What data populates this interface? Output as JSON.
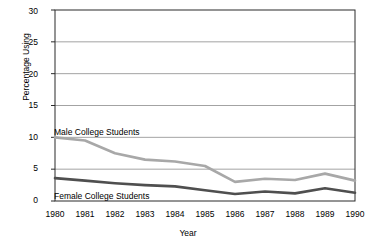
{
  "chart_data": {
    "type": "line",
    "title": "",
    "xlabel": "Year",
    "ylabel": "Percentage Using",
    "categories": [
      "1980",
      "1981",
      "1982",
      "1983",
      "1984",
      "1985",
      "1986",
      "1987",
      "1988",
      "1989",
      "1990"
    ],
    "x": [
      1980,
      1981,
      1982,
      1983,
      1984,
      1985,
      1986,
      1987,
      1988,
      1989,
      1990
    ],
    "xlim": [
      1980,
      1990
    ],
    "ylim": [
      0,
      30
    ],
    "yticks": [
      0,
      5,
      10,
      15,
      20,
      25,
      30
    ],
    "ytick_labels": [
      "0",
      "5",
      "10",
      "15",
      "20",
      "25",
      "30"
    ],
    "grid": true,
    "grid_axis": "y",
    "legend": "inline-annotations",
    "series": [
      {
        "name": "Male College Students",
        "color": "#a8a8a8",
        "width": 2.6,
        "values": [
          10.0,
          9.5,
          7.5,
          6.5,
          6.2,
          5.5,
          3.0,
          3.5,
          3.3,
          4.3,
          3.2
        ]
      },
      {
        "name": "Female College Students",
        "color": "#4f4f4f",
        "width": 2.6,
        "values": [
          3.6,
          3.2,
          2.8,
          2.5,
          2.3,
          1.7,
          1.1,
          1.5,
          1.2,
          2.0,
          1.3
        ]
      }
    ]
  },
  "axes": {
    "y_title": "Percentage Using",
    "x_title": "Year"
  },
  "annotations": {
    "male_label": "Male College Students",
    "female_label": "Female College Students"
  },
  "colors": {
    "male": "#a8a8a8",
    "female": "#4f4f4f",
    "axis": "#2a2a2a",
    "grid": "#8c8c8c",
    "background": "#ffffff"
  },
  "cut_title": ""
}
